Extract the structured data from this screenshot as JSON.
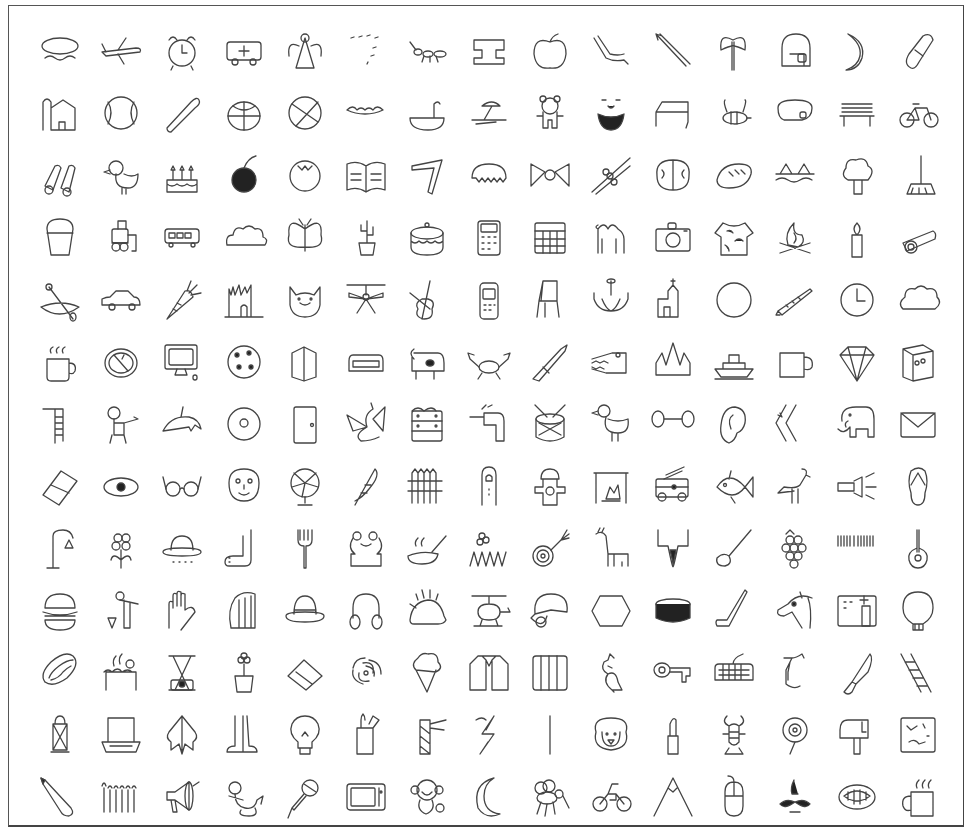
{
  "grid": {
    "columns": 15,
    "rows": 13
  },
  "sketches": [
    "airplane-boat",
    "airplane",
    "alarm clock",
    "ambulance",
    "angel",
    "animal migration",
    "ant",
    "anvil",
    "apple",
    "arm",
    "arrow",
    "axe",
    "backpack",
    "banana",
    "bandage",
    "barn",
    "baseball",
    "baseball bat",
    "basket",
    "basketball",
    "bat",
    "bathtub",
    "beach",
    "bear",
    "beard",
    "bed",
    "bee",
    "belt",
    "bench",
    "bicycle",
    "binoculars",
    "bird",
    "birthday cake",
    "blackberry",
    "blueberry",
    "book",
    "boomerang",
    "bottlecap",
    "bowtie",
    "bracelet",
    "brain",
    "bread",
    "bridge",
    "broccoli",
    "broom",
    "bucket",
    "bulldozer",
    "bus",
    "bush",
    "butterfly",
    "cactus",
    "cake",
    "calculator",
    "calendar",
    "camel",
    "camera",
    "camouflage",
    "campfire",
    "candle",
    "cannon",
    "canoe",
    "car",
    "carrot",
    "castle",
    "cat",
    "ceiling fan",
    "cello",
    "cell phone",
    "chair",
    "chandelier",
    "church",
    "circle",
    "clarinet",
    "clock",
    "cloud",
    "coffee cup",
    "compass",
    "computer",
    "cookie",
    "cooler",
    "couch",
    "cow",
    "crab",
    "crayon",
    "crocodile",
    "crown",
    "cruise ship",
    "cup",
    "diamond",
    "dishwasher",
    "diving board",
    "dog",
    "dolphin",
    "donut",
    "door",
    "dragon",
    "dresser",
    "drill",
    "drums",
    "duck",
    "dumbbell",
    "ear",
    "elbow",
    "elephant",
    "envelope",
    "eraser",
    "eye",
    "eyeglasses",
    "face",
    "fan",
    "feather",
    "fence",
    "finger",
    "fire hydrant",
    "fireplace",
    "firetruck",
    "fish",
    "flamingo",
    "flashlight",
    "flip flops",
    "floor lamp",
    "flower",
    "flying saucer",
    "foot",
    "fork",
    "frog",
    "frying pan",
    "garden",
    "garden hose",
    "giraffe",
    "goatee",
    "golf club",
    "grapes",
    "grass",
    "guitar",
    "hamburger",
    "hammer",
    "hand",
    "harp",
    "hat",
    "headphones",
    "hedgehog",
    "helicopter",
    "helmet",
    "hexagon",
    "hockey puck",
    "hockey stick",
    "horse",
    "hospital",
    "hot air balloon",
    "hot dog",
    "hot tub",
    "hourglass",
    "house plant",
    "house",
    "hurricane",
    "ice cream",
    "jacket",
    "jail",
    "kangaroo",
    "key",
    "keyboard",
    "knee",
    "knife",
    "ladder",
    "lantern",
    "laptop",
    "leaf",
    "leg",
    "light bulb",
    "lighter",
    "lighthouse",
    "lightning",
    "line",
    "lion",
    "lipstick",
    "lobster",
    "lollipop",
    "mailbox",
    "map",
    "marker",
    "matches",
    "megaphone",
    "mermaid",
    "microphone",
    "microwave",
    "monkey",
    "moon",
    "mosquito",
    "motorbike",
    "mountain",
    "mouse",
    "moustache",
    "mouth",
    "mug"
  ],
  "colors": {
    "stroke": "#444444",
    "frame": "#555555",
    "background": "#ffffff"
  }
}
